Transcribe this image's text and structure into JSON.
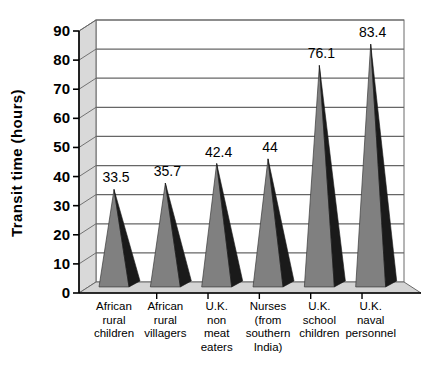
{
  "chart_data": {
    "type": "bar",
    "title": "",
    "subtitle": "",
    "xlabel": "",
    "ylabel": "Transit  time  (hours)",
    "ylim": [
      0,
      90
    ],
    "ytick_step": 10,
    "yticks": [
      "0",
      "10",
      "20",
      "30",
      "40",
      "50",
      "60",
      "70",
      "80",
      "90"
    ],
    "grid": true,
    "legend": "none",
    "style": "3d-cone-bars",
    "categories": [
      "African\nrural\nchildren",
      "African\nrural\nvillagers",
      "U.K.\nnon\nmeat\neaters",
      "Nurses\n(from\nsouthern\nIndia)",
      "U.K.\nschool\nchildren",
      "U.K.\nnaval\npersonnel"
    ],
    "category_lines": [
      [
        "African",
        "rural",
        "children"
      ],
      [
        "African",
        "rural",
        "villagers"
      ],
      [
        "U.K.",
        "non",
        "meat",
        "eaters"
      ],
      [
        "Nurses",
        "(from",
        "southern",
        "India)"
      ],
      [
        "U.K.",
        "school",
        "children"
      ],
      [
        "U.K.",
        "naval",
        "personnel"
      ]
    ],
    "values": [
      33.5,
      35.7,
      42.4,
      44,
      76.1,
      83.4
    ],
    "value_labels": [
      "33.5",
      "35.7",
      "42.4",
      "44",
      "76.1",
      "83.4"
    ]
  },
  "colors": {
    "bar_front": "#808080",
    "bar_side": "#1a1a1a",
    "wall": "#ffffff",
    "floor": "#d4d4d4",
    "left_panel": "#d9d9d9",
    "gridline": "#666666",
    "axis": "#000000",
    "background": "#ffffff",
    "text": "#000000"
  }
}
